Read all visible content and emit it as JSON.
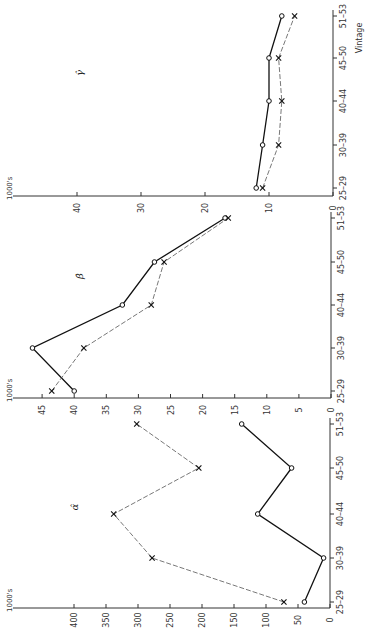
{
  "chart_data": [
    {
      "type": "line",
      "panel": "gamma",
      "title": "γ̂",
      "xlabel": "Vintage",
      "ylabel": "1000's",
      "categories": [
        "25-29",
        "30-39",
        "40-44",
        "45-50",
        "51-53"
      ],
      "yticks": [
        0,
        10,
        20,
        30,
        40
      ],
      "ylim": [
        0,
        47
      ],
      "series": [
        {
          "name": "estimate (solid, circles)",
          "marker": "circle",
          "style": "solid",
          "values": [
            12,
            11,
            10,
            10,
            8
          ]
        },
        {
          "name": "estimate (dashed, crosses)",
          "marker": "x",
          "style": "dashed",
          "values": [
            11,
            8.5,
            8,
            8.5,
            6
          ]
        }
      ]
    },
    {
      "type": "line",
      "panel": "beta",
      "title": "β̂",
      "xlabel": "",
      "ylabel": "1000's",
      "categories": [
        "25-29",
        "30-39",
        "40-44",
        "45-50",
        "51-53"
      ],
      "yticks": [
        0,
        5,
        10,
        15,
        20,
        25,
        30,
        35,
        40,
        45
      ],
      "ylim": [
        0,
        47
      ],
      "series": [
        {
          "name": "estimate (solid, circles)",
          "marker": "circle",
          "style": "solid",
          "values": [
            40,
            46.5,
            32.5,
            27.5,
            16.5
          ]
        },
        {
          "name": "estimate (dashed, crosses)",
          "marker": "x",
          "style": "dashed",
          "values": [
            43.5,
            38.5,
            28,
            26,
            16
          ]
        }
      ]
    },
    {
      "type": "line",
      "panel": "alpha",
      "title": "α̂",
      "xlabel": "",
      "ylabel": "1000's",
      "categories": [
        "25-29",
        "30-39",
        "40-44",
        "45-50",
        "51-53"
      ],
      "yticks": [
        0,
        50,
        100,
        150,
        200,
        250,
        300,
        350,
        400
      ],
      "ylim": [
        0,
        470
      ],
      "series": [
        {
          "name": "estimate (solid, circles)",
          "marker": "circle",
          "style": "solid",
          "values": [
            40,
            10,
            113,
            60,
            138
          ]
        },
        {
          "name": "estimate (dashed, crosses)",
          "marker": "x",
          "style": "dashed",
          "values": [
            72,
            278,
            338,
            205,
            302
          ]
        }
      ]
    }
  ],
  "labels": {
    "unit": "1000's",
    "vintage_axis": "Vintage",
    "gamma": "γ̂",
    "beta": "β̂",
    "alpha": "α̂"
  },
  "layout": {
    "orientation": "rotated-90-ccw",
    "panels": {
      "gamma": {
        "zero_x": 333,
        "px_per_unit": 6.4,
        "axis_y": 196,
        "axis_x_end": 13,
        "cat_y": [
          188,
          145,
          101,
          58,
          16
        ],
        "label_pos": [
          83,
          73
        ]
      },
      "beta": {
        "zero_x": 331,
        "px_per_unit": 6.42,
        "axis_y": 398,
        "axis_x_end": 13,
        "cat_y": [
          391,
          348,
          305,
          262,
          218
        ],
        "label_pos": [
          83,
          276
        ]
      },
      "alpha": {
        "zero_x": 330,
        "px_per_unit": 0.64,
        "axis_y": 608,
        "axis_x_end": 13,
        "cat_y": [
          602,
          558,
          514,
          468,
          424
        ],
        "label_pos": [
          78,
          507
        ]
      }
    }
  }
}
